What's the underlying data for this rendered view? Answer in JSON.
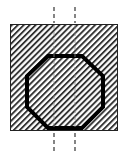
{
  "diagram": {
    "type": "cross-section",
    "colors": {
      "background": "#ffffff",
      "hatch": "#333333",
      "outline": "#222222",
      "octagon_stroke": "#000000",
      "centerline": "#444444"
    },
    "square": {
      "x": 10,
      "y": 24,
      "width": 108,
      "height": 107
    },
    "octagon": {
      "points": [
        [
          48,
          56
        ],
        [
          82,
          56
        ],
        [
          103,
          76
        ],
        [
          103,
          107
        ],
        [
          82,
          128
        ],
        [
          48,
          128
        ],
        [
          27,
          107
        ],
        [
          27,
          76
        ]
      ],
      "stroke_width": 4
    },
    "centerlines": [
      {
        "x": 54,
        "segments": [
          [
            7,
            23
          ],
          [
            132,
            152
          ]
        ]
      },
      {
        "x": 75,
        "segments": [
          [
            7,
            23
          ],
          [
            132,
            152
          ]
        ]
      }
    ]
  }
}
